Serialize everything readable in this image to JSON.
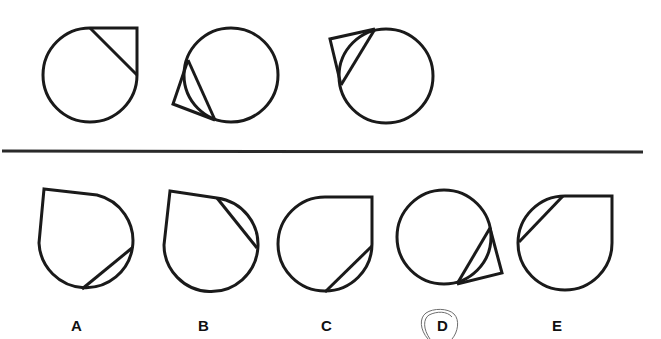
{
  "puzzle": {
    "question_row": {
      "figures": [
        {
          "id": "q1",
          "description": "circle with square corner at top-right, diagonal chord"
        },
        {
          "id": "q2",
          "description": "circle with kite/triangle flap at lower-left"
        },
        {
          "id": "q3",
          "description": "circle with kite/triangle flap at upper-left"
        }
      ]
    },
    "answer_row": {
      "options": [
        {
          "label": "A",
          "description": "teardrop with corner top-left, chord at lower-right"
        },
        {
          "label": "B",
          "description": "teardrop with corner top-left, chord at upper-right"
        },
        {
          "label": "C",
          "description": "teardrop with corner top-right, chord at lower-right"
        },
        {
          "label": "D",
          "description": "circle with kite flap at lower-right"
        },
        {
          "label": "E",
          "description": "teardrop with corner top-right, chord at upper-left"
        }
      ]
    },
    "annotation": {
      "circled_option": "D"
    },
    "colors": {
      "stroke": "#1a1a1a",
      "background": "#ffffff",
      "pencil": "#6e6e6e"
    }
  }
}
